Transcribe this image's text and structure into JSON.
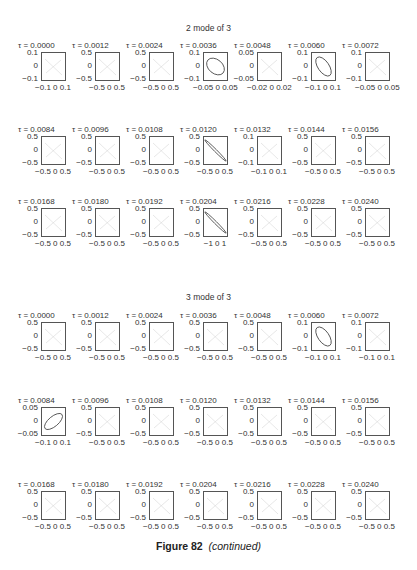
{
  "chart_data": [
    {
      "type": "scatter",
      "title": "2 mode of 3",
      "subplots": [
        {
          "tau": "τ = 0.0000",
          "ylim": [
            "0.1",
            "0",
            "−0.1"
          ],
          "xlim": "−0.1 0 0.1",
          "curve": "faint"
        },
        {
          "tau": "τ = 0.0012",
          "ylim": [
            "0.5",
            "0",
            "−0.5"
          ],
          "xlim": "−0.5 0 0.5",
          "curve": "faint"
        },
        {
          "tau": "τ = 0.0024",
          "ylim": [
            "0.5",
            "0",
            "−0.5"
          ],
          "xlim": "−0.5 0 0.5",
          "curve": "faint"
        },
        {
          "tau": "τ = 0.0036",
          "ylim": [
            "0.1",
            "0",
            "−0.1"
          ],
          "xlim": "−0.05 0 0.05",
          "curve": "ellipse-neg"
        },
        {
          "tau": "τ = 0.0048",
          "ylim": [
            "0.05",
            "0",
            "−0.05"
          ],
          "xlim": "−0.02 0 0.02",
          "curve": "faint"
        },
        {
          "tau": "τ = 0.0060",
          "ylim": [
            "0.1",
            "0",
            "−0.1"
          ],
          "xlim": "−0.1 0 0.1",
          "curve": "ellipse-neg-narrow"
        },
        {
          "tau": "τ = 0.0072",
          "ylim": [
            "0.1",
            "0",
            "−0.1"
          ],
          "xlim": "−0.05 0 0.05",
          "curve": "faint"
        },
        {
          "tau": "τ = 0.0084",
          "ylim": [
            "0.5",
            "0",
            "−0.5"
          ],
          "xlim": "−0.5 0 0.5",
          "curve": "faint"
        },
        {
          "tau": "τ = 0.0096",
          "ylim": [
            "0.5",
            "0",
            "−0.5"
          ],
          "xlim": "−0.5 0 0.5",
          "curve": "faint"
        },
        {
          "tau": "τ = 0.0108",
          "ylim": [
            "0.5",
            "0",
            "−0.5"
          ],
          "xlim": "−0.5 0 0.5",
          "curve": "faint"
        },
        {
          "tau": "τ = 0.0120",
          "ylim": [
            "0.5",
            "0",
            "−0.5"
          ],
          "xlim": "−0.5 0 0.5",
          "curve": "line-neg"
        },
        {
          "tau": "τ = 0.0132",
          "ylim": [
            "0.1",
            "0",
            "−0.1"
          ],
          "xlim": "−0.1 0 0.1",
          "curve": "faint"
        },
        {
          "tau": "τ = 0.0144",
          "ylim": [
            "0.5",
            "0",
            "−0.5"
          ],
          "xlim": "−0.5 0 0.5",
          "curve": "faint"
        },
        {
          "tau": "τ = 0.0156",
          "ylim": [
            "0.5",
            "0",
            "−0.5"
          ],
          "xlim": "−0.5 0 0.5",
          "curve": "faint"
        },
        {
          "tau": "τ = 0.0168",
          "ylim": [
            "0.5",
            "0",
            "−0.5"
          ],
          "xlim": "−0.5 0 0.5",
          "curve": "faint"
        },
        {
          "tau": "τ = 0.0180",
          "ylim": [
            "0.5",
            "0",
            "−0.5"
          ],
          "xlim": "−0.5 0 0.5",
          "curve": "faint"
        },
        {
          "tau": "τ = 0.0192",
          "ylim": [
            "0.5",
            "0",
            "−0.5"
          ],
          "xlim": "−0.5 0 0.5",
          "curve": "faint"
        },
        {
          "tau": "τ = 0.0204",
          "ylim": [
            "0.5",
            "0",
            "−0.5"
          ],
          "xlim": "−1 0 1",
          "curve": "line-neg"
        },
        {
          "tau": "τ = 0.0216",
          "ylim": [
            "0.5",
            "0",
            "−0.5"
          ],
          "xlim": "−0.5 0 0.5",
          "curve": "faint"
        },
        {
          "tau": "τ = 0.0228",
          "ylim": [
            "0.5",
            "0",
            "−0.5"
          ],
          "xlim": "−0.5 0 0.5",
          "curve": "faint"
        },
        {
          "tau": "τ = 0.0240",
          "ylim": [
            "0.5",
            "0",
            "−0.5"
          ],
          "xlim": "−0.5 0 0.5",
          "curve": "faint"
        }
      ]
    },
    {
      "type": "scatter",
      "title": "3 mode of 3",
      "subplots": [
        {
          "tau": "τ = 0.0000",
          "ylim": [
            "0.5",
            "0",
            "−0.5"
          ],
          "xlim": "−0.5 0 0.5",
          "curve": "faint"
        },
        {
          "tau": "τ = 0.0012",
          "ylim": [
            "0.5",
            "0",
            "−0.5"
          ],
          "xlim": "−0.5 0 0.5",
          "curve": "faint"
        },
        {
          "tau": "τ = 0.0024",
          "ylim": [
            "0.5",
            "0",
            "−0.5"
          ],
          "xlim": "−0.5 0 0.5",
          "curve": "faint"
        },
        {
          "tau": "τ = 0.0036",
          "ylim": [
            "0.5",
            "0",
            "−0.5"
          ],
          "xlim": "−0.5 0 0.5",
          "curve": "faint"
        },
        {
          "tau": "τ = 0.0048",
          "ylim": [
            "0.5",
            "0",
            "−0.5"
          ],
          "xlim": "−0.5 0 0.5",
          "curve": "faint"
        },
        {
          "tau": "τ = 0.0060",
          "ylim": [
            "0.1",
            "0",
            "−0.1"
          ],
          "xlim": "−0.1 0 0.1",
          "curve": "ellipse-neg-narrow"
        },
        {
          "tau": "τ = 0.0072",
          "ylim": [
            "0.1",
            "0",
            "−0.1"
          ],
          "xlim": "−0.1 0 0.1",
          "curve": "faint"
        },
        {
          "tau": "τ = 0.0084",
          "ylim": [
            "0.05",
            "0",
            "−0.05"
          ],
          "xlim": "−0.1 0 0.1",
          "curve": "ellipse-pos"
        },
        {
          "tau": "τ = 0.0096",
          "ylim": [
            "0.5",
            "0",
            "−0.5"
          ],
          "xlim": "−0.5 0 0.5",
          "curve": "faint"
        },
        {
          "tau": "τ = 0.0108",
          "ylim": [
            "0.5",
            "0",
            "−0.5"
          ],
          "xlim": "−0.5 0 0.5",
          "curve": "faint"
        },
        {
          "tau": "τ = 0.0120",
          "ylim": [
            "0.5",
            "0",
            "−0.5"
          ],
          "xlim": "−0.5 0 0.5",
          "curve": "faint"
        },
        {
          "tau": "τ = 0.0132",
          "ylim": [
            "0.5",
            "0",
            "−0.5"
          ],
          "xlim": "−0.5 0 0.5",
          "curve": "faint"
        },
        {
          "tau": "τ = 0.0144",
          "ylim": [
            "0.5",
            "0",
            "−0.5"
          ],
          "xlim": "−0.5 0 0.5",
          "curve": "faint"
        },
        {
          "tau": "τ = 0.0156",
          "ylim": [
            "0.5",
            "0",
            "−0.5"
          ],
          "xlim": "−0.5 0 0.5",
          "curve": "faint"
        },
        {
          "tau": "τ = 0.0168",
          "ylim": [
            "0.5",
            "0",
            "−0.5"
          ],
          "xlim": "−0.5 0 0.5",
          "curve": "faint"
        },
        {
          "tau": "τ = 0.0180",
          "ylim": [
            "0.5",
            "0",
            "−0.5"
          ],
          "xlim": "−0.5 0 0.5",
          "curve": "faint"
        },
        {
          "tau": "τ = 0.0192",
          "ylim": [
            "0.5",
            "0",
            "−0.5"
          ],
          "xlim": "−0.5 0 0.5",
          "curve": "faint"
        },
        {
          "tau": "τ = 0.0204",
          "ylim": [
            "0.5",
            "0",
            "−0.5"
          ],
          "xlim": "−0.5 0 0.5",
          "curve": "faint"
        },
        {
          "tau": "τ = 0.0216",
          "ylim": [
            "0.5",
            "0",
            "−0.5"
          ],
          "xlim": "−0.5 0 0.5",
          "curve": "faint"
        },
        {
          "tau": "τ = 0.0228",
          "ylim": [
            "0.5",
            "0",
            "−0.5"
          ],
          "xlim": "−0.5 0 0.5",
          "curve": "faint"
        },
        {
          "tau": "τ = 0.0240",
          "ylim": [
            "0.5",
            "0",
            "−0.5"
          ],
          "xlim": "−0.5 0 0.5",
          "curve": "faint"
        }
      ]
    }
  ],
  "caption": {
    "label": "Figure 82",
    "note": "(continued)"
  },
  "colors": {
    "axis": "#555555",
    "curve": "#555555",
    "faint": "#dddddd",
    "text": "#333333"
  }
}
